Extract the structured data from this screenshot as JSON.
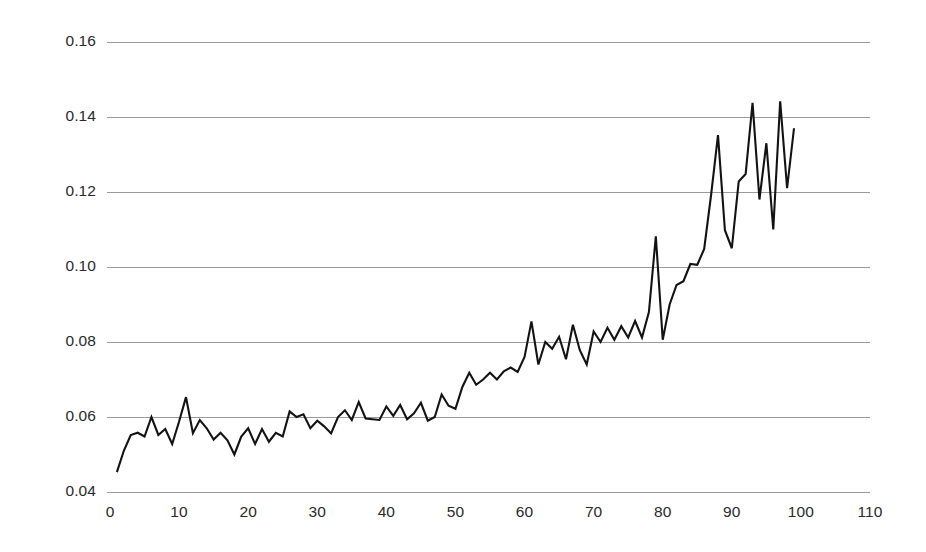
{
  "chart_data": {
    "type": "line",
    "title": "",
    "subtitle": "",
    "xlabel": "",
    "ylabel": "",
    "xlim": [
      0,
      110
    ],
    "ylim": [
      0.04,
      0.16
    ],
    "grid": "horizontal",
    "legend": "none",
    "line_color": "#131313",
    "gridline_color": "#9b9b9b",
    "background_color": "#ffffff",
    "y_ticks": [
      0.04,
      0.06,
      0.08,
      0.1,
      0.12,
      0.14,
      0.16
    ],
    "y_tick_labels": [
      "0.04",
      "0.06",
      "0.08",
      "0.10",
      "0.12",
      "0.14",
      "0.16"
    ],
    "x_ticks": [
      0,
      10,
      20,
      30,
      40,
      50,
      60,
      70,
      80,
      90,
      100,
      110
    ],
    "x_tick_labels": [
      "0",
      "10",
      "20",
      "30",
      "40",
      "50",
      "60",
      "70",
      "80",
      "90",
      "100",
      "110"
    ],
    "series": [
      {
        "name": "series-1",
        "x": [
          1,
          2,
          3,
          4,
          5,
          6,
          7,
          8,
          9,
          10,
          11,
          12,
          13,
          14,
          15,
          16,
          17,
          18,
          19,
          20,
          21,
          22,
          23,
          24,
          25,
          26,
          27,
          28,
          29,
          30,
          31,
          32,
          33,
          34,
          35,
          36,
          37,
          38,
          39,
          40,
          41,
          42,
          43,
          44,
          45,
          46,
          47,
          48,
          49,
          50,
          51,
          52,
          53,
          54,
          55,
          56,
          57,
          58,
          59,
          60,
          61,
          62,
          63,
          64,
          65,
          66,
          67,
          68,
          69,
          70,
          71,
          72,
          73,
          74,
          75,
          76,
          77,
          78,
          79,
          80,
          81,
          82,
          83,
          84,
          85,
          86,
          87,
          88,
          89,
          90,
          91,
          92,
          93,
          94,
          95,
          96,
          97,
          98,
          99
        ],
        "y": [
          0.0453,
          0.051,
          0.0552,
          0.0558,
          0.0548,
          0.06,
          0.0552,
          0.0568,
          0.0528,
          0.0588,
          0.0653,
          0.0557,
          0.0592,
          0.057,
          0.054,
          0.0558,
          0.0538,
          0.05,
          0.0548,
          0.057,
          0.0528,
          0.0568,
          0.0534,
          0.0558,
          0.0548,
          0.0615,
          0.06,
          0.0607,
          0.057,
          0.059,
          0.0575,
          0.0556,
          0.06,
          0.0618,
          0.0592,
          0.064,
          0.0596,
          0.0594,
          0.0592,
          0.0628,
          0.0603,
          0.0632,
          0.0594,
          0.061,
          0.0638,
          0.059,
          0.06,
          0.066,
          0.063,
          0.0622,
          0.068,
          0.0718,
          0.0686,
          0.07,
          0.0718,
          0.07,
          0.0722,
          0.0732,
          0.072,
          0.076,
          0.0855,
          0.074,
          0.08,
          0.0782,
          0.0814,
          0.0754,
          0.0846,
          0.0778,
          0.074,
          0.0828,
          0.08,
          0.0838,
          0.0806,
          0.0842,
          0.0812,
          0.0856,
          0.0812,
          0.088,
          0.1082,
          0.0806,
          0.09,
          0.0952,
          0.0962,
          0.1008,
          0.1006,
          0.1048,
          0.1192,
          0.1352,
          0.1098,
          0.105,
          0.1228,
          0.1248,
          0.1438,
          0.118,
          0.133,
          0.11,
          0.1442,
          0.121,
          0.137
        ]
      }
    ]
  },
  "axes": {
    "plot_left_px": 110,
    "plot_right_px": 870,
    "y_top_value": 0.16,
    "y_top_px": 42,
    "y_bottom_value": 0.04,
    "y_bottom_px": 492,
    "gridline_right_px": 870,
    "gridline_left_px": 107
  }
}
